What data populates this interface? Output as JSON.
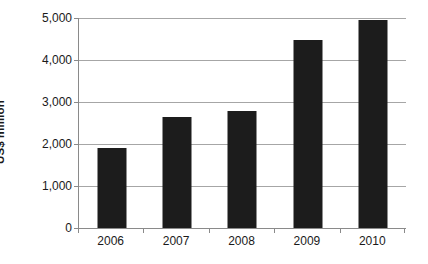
{
  "chart_data": {
    "type": "bar",
    "title": "",
    "subtitle": "",
    "xlabel": "",
    "ylabel": "US$ million",
    "categories": [
      "2006",
      "2007",
      "2008",
      "2009",
      "2010"
    ],
    "values": [
      1900,
      2640,
      2780,
      4480,
      4960
    ],
    "series": [
      {
        "name": "US$ million",
        "values": [
          1900,
          2640,
          2780,
          4480,
          4960
        ],
        "color": "#1c1c1c"
      }
    ],
    "ylim": [
      0,
      5000
    ],
    "ytick_values": [
      0,
      1000,
      2000,
      3000,
      4000,
      5000
    ],
    "ytick_labels": [
      "0",
      "1,000",
      "2,000",
      "3,000",
      "4,000",
      "5,000"
    ],
    "xtick_labels": [
      "2006",
      "2007",
      "2008",
      "2009",
      "2010"
    ],
    "grid": "horizontal",
    "legend": "none",
    "annotations": [],
    "colors": {
      "bar": "#1c1c1c",
      "gridline": "#a6a6a6",
      "axis": "#8a8a8a",
      "text": "#1a1a1a",
      "background": "#ffffff"
    }
  }
}
